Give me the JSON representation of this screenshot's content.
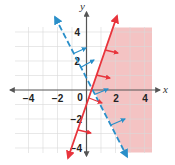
{
  "graph": {
    "type": "system-of-linear-inequalities",
    "axis_labels": {
      "x": "x",
      "y": "y"
    },
    "x_ticks": [
      {
        "value": -4,
        "label": "−4"
      },
      {
        "value": -2,
        "label": "−2"
      },
      {
        "value": 2,
        "label": "2"
      },
      {
        "value": 4,
        "label": "4"
      }
    ],
    "y_ticks": [
      {
        "value": 4,
        "label": "4"
      },
      {
        "value": 2,
        "label": "2"
      },
      {
        "value": -2,
        "label": "−2"
      },
      {
        "value": -4,
        "label": "−4"
      }
    ],
    "origin_label": "0",
    "range": {
      "x": [
        -4.5,
        4.5
      ],
      "y": [
        -4.5,
        4.5
      ]
    },
    "grid_step": 1,
    "colors": {
      "grid": "#d9d9d9",
      "axis": "#555555",
      "red_line": "#e8343c",
      "blue_line": "#2a8fc9",
      "shade": "#f2b8b8"
    },
    "lines": [
      {
        "name": "red-boundary",
        "equation": "y = 3x - 1",
        "style": "solid",
        "color": "#e8343c",
        "shade_side": "right"
      },
      {
        "name": "blue-boundary",
        "equation": "y = -2x + 1",
        "style": "dashed",
        "color": "#2a8fc9",
        "shade_side": "right"
      }
    ],
    "solution_region": "shaded right of both lines"
  }
}
